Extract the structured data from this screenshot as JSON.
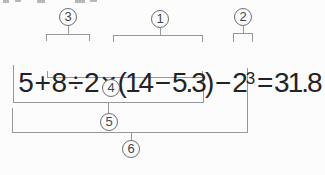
{
  "expression": {
    "full": "5 + 8 ÷ 2 × (14 − 5.3) − 2³ = 31.8",
    "segment_main": "5 + 8 ÷ 2 × (14 − 5.3) − 2",
    "exponent": "3",
    "segment_result": " = 31.8",
    "result_value": "31.8"
  },
  "order_badges": [
    {
      "label": "3",
      "position": "above",
      "covers": "8 ÷ 2"
    },
    {
      "label": "1",
      "position": "above",
      "covers": "(14 − 5.3)"
    },
    {
      "label": "2",
      "position": "above",
      "covers": "2³"
    },
    {
      "label": "4",
      "position": "below",
      "covers": "8 ÷ 2 × (14 − 5.3)"
    },
    {
      "label": "5",
      "position": "below",
      "covers": "5 + 8 ÷ 2 × (14 − 5.3)"
    },
    {
      "label": "6",
      "position": "below",
      "covers": "5 + 8 ÷ 2 × (14 − 5.3) − 2³"
    }
  ],
  "colors": {
    "background": "#fcfcfc",
    "text": "#212326",
    "line": "#96999b",
    "circle_stroke": "#6a6f72",
    "badge_text": "#43474a",
    "remnant": "#b4b8ba"
  }
}
